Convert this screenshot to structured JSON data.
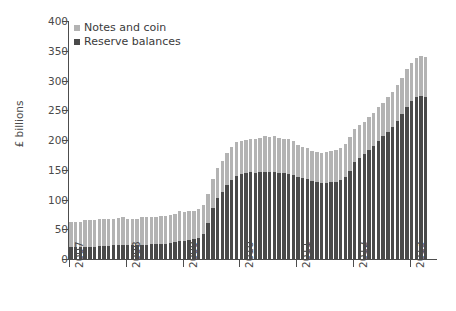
{
  "chart_data": {
    "type": "bar",
    "subtype": "stacked-bar",
    "title": "",
    "xlabel": "",
    "ylabel": "£ billions",
    "ylim": [
      0,
      400
    ],
    "yticks": [
      0,
      50,
      100,
      150,
      200,
      250,
      300,
      350,
      400
    ],
    "xticks": [
      "2007",
      "2008",
      "2009",
      "2010",
      "2011",
      "2012",
      "2013"
    ],
    "grid": false,
    "legend_position": "top-left",
    "colors": {
      "notes_and_coin": "#b3b3b3",
      "reserve_balances": "#4a4a4a",
      "axis": "#4d4d4d",
      "text": "#4a4a4a",
      "background": "#ffffff"
    },
    "legend": [
      {
        "label": "Notes and coin",
        "color": "#b3b3b3"
      },
      {
        "label": "Reserve balances",
        "color": "#4a4a4a"
      }
    ],
    "x_start": "2007-01",
    "x_frequency": "monthly",
    "series": [
      {
        "name": "Reserve balances",
        "color": "#4a4a4a",
        "values": [
          20,
          20,
          20,
          21,
          21,
          21,
          22,
          22,
          22,
          23,
          23,
          23,
          23,
          23,
          23,
          24,
          24,
          25,
          25,
          25,
          26,
          27,
          28,
          30,
          31,
          32,
          33,
          36,
          42,
          60,
          85,
          102,
          113,
          125,
          133,
          139,
          143,
          145,
          146,
          145,
          146,
          147,
          146,
          146,
          145,
          144,
          143,
          141,
          138,
          136,
          134,
          131,
          129,
          128,
          128,
          129,
          130,
          133,
          138,
          148,
          163,
          170,
          176,
          183,
          190,
          198,
          206,
          214,
          222,
          232,
          243,
          255,
          266,
          272,
          274,
          272
        ]
      },
      {
        "name": "Notes and coin",
        "color": "#b3b3b3",
        "values": [
          43,
          43,
          43,
          44,
          44,
          45,
          45,
          45,
          45,
          45,
          46,
          47,
          45,
          45,
          45,
          46,
          46,
          46,
          46,
          47,
          47,
          47,
          48,
          50,
          48,
          48,
          48,
          48,
          49,
          50,
          50,
          51,
          52,
          53,
          55,
          57,
          55,
          55,
          56,
          57,
          58,
          59,
          59,
          60,
          59,
          58,
          58,
          58,
          54,
          53,
          52,
          51,
          51,
          51,
          52,
          52,
          53,
          54,
          55,
          57,
          55,
          55,
          55,
          56,
          56,
          57,
          57,
          58,
          59,
          60,
          62,
          65,
          64,
          66,
          67,
          67
        ]
      }
    ],
    "totals_note": "Stacked totals range from ~63 at 2007 to ~345 peak in 2013"
  },
  "legend_items": [
    {
      "label": "Notes and coin"
    },
    {
      "label": "Reserve balances"
    }
  ]
}
